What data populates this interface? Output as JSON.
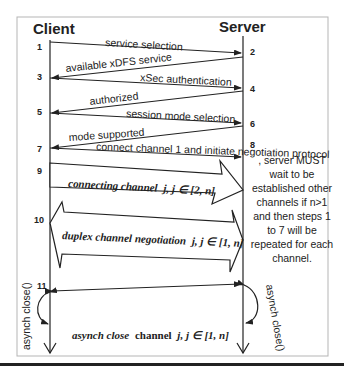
{
  "diagram": {
    "participants": {
      "client": "Client",
      "server": "Server"
    },
    "steps": [
      {
        "id": "1",
        "side": "client"
      },
      {
        "id": "2",
        "side": "server"
      },
      {
        "id": "3",
        "side": "client"
      },
      {
        "id": "4",
        "side": "server"
      },
      {
        "id": "5",
        "side": "client"
      },
      {
        "id": "6",
        "side": "server"
      },
      {
        "id": "7",
        "side": "client"
      },
      {
        "id": "8",
        "side": "server"
      },
      {
        "id": "9",
        "side": "client"
      },
      {
        "id": "10",
        "side": "client"
      },
      {
        "id": "11",
        "side": "client"
      }
    ],
    "messages": [
      {
        "from": "client",
        "to": "server",
        "label": "service selection"
      },
      {
        "from": "server",
        "to": "client",
        "label": "available xDFS service"
      },
      {
        "from": "client",
        "to": "server",
        "label": "xSec authentication"
      },
      {
        "from": "server",
        "to": "client",
        "label": "authorized"
      },
      {
        "from": "client",
        "to": "server",
        "label": "session mode selection"
      },
      {
        "from": "server",
        "to": "client",
        "label": "mode supported"
      },
      {
        "from": "client",
        "to": "server",
        "label": "connect channel 1 and initiate negotiation protocol"
      }
    ],
    "big_arrows": {
      "connecting": {
        "label_italic": "connecting channel",
        "label_math": "j, j ∈ [2, n]"
      },
      "duplex": {
        "label_italic": "duplex channel negotiation",
        "label_math": "j, j ∈ [1, n]"
      }
    },
    "note": {
      "lines": [
        ", server MUST",
        "wait to be",
        "established other",
        "channels if n>1",
        "and then steps 1",
        "to 7 will be",
        "repeated for each",
        "channel."
      ]
    },
    "close": {
      "client_label": "asynch close()",
      "server_label": "asynch close()",
      "channel_label_italic": "asynch close",
      "channel_label_plain": "channel",
      "channel_label_math": "j, j ∈ [1, n]"
    }
  }
}
